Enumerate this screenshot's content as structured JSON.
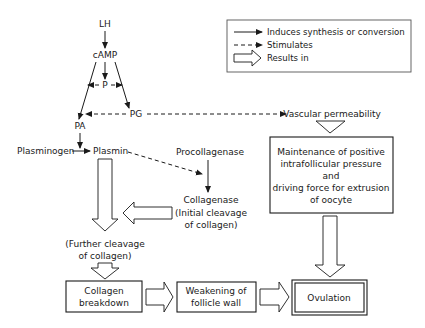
{
  "legend": {
    "items": [
      {
        "symbol": "solid-arrow",
        "label": "Induces synthesis or conversion"
      },
      {
        "symbol": "dashed-arrow",
        "label": "Stimulates"
      },
      {
        "symbol": "hollow-arrow",
        "label": "Results in"
      }
    ]
  },
  "nodes": {
    "lh": "LH",
    "camp": "cAMP",
    "p": "P",
    "pg": "PG",
    "pa": "PA",
    "plasminogen": "Plasminogen",
    "plasmin": "Plasmin",
    "procollagenase": "Procollagenase",
    "collagenase": "Collagenase",
    "initial_cleavage_1": "(Initial cleavage",
    "initial_cleavage_2": "of collagen)",
    "further_cleavage_1": "(Further cleavage",
    "further_cleavage_2": "of collagen)",
    "vascular_permeability": "Vascular permeability",
    "maintenance_box": {
      "line1": "Maintenance of positive",
      "line2": "intrafollicular pressure",
      "line3": "and",
      "line4": "driving force for extrusion",
      "line5": "of oocyte"
    },
    "collagen_breakdown": {
      "line1": "Collagen",
      "line2": "breakdown"
    },
    "weakening": {
      "line1": "Weakening of",
      "line2": "follicle wall"
    },
    "ovulation": "Ovulation"
  }
}
